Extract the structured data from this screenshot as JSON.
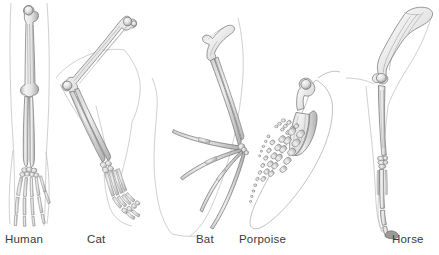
{
  "figure": {
    "style": "grayscale pencil / airbrush scientific illustration",
    "background_color": "#ffffff",
    "bone_fill_light": "#f2f2f2",
    "bone_fill_mid": "#d9d9d9",
    "bone_fill_dark": "#b4b4b4",
    "bone_outline_color": "#6e6e6e",
    "body_outline_color": "#a8a8a8",
    "label_color": "#3a3a3a"
  },
  "specimens": [
    {
      "id": "human",
      "label": "Human",
      "label_x": 5,
      "orientation": "vertical, hand down",
      "bones": [
        "humerus",
        "radius",
        "ulna",
        "carpals",
        "metacarpals",
        "phalanges"
      ],
      "digit_count": 5
    },
    {
      "id": "cat",
      "label": "Cat",
      "label_x": 87,
      "orientation": "flexed diagonal, paw down",
      "bones": [
        "humerus",
        "radius",
        "ulna",
        "carpals",
        "metacarpals",
        "phalanges"
      ],
      "digit_count": 5
    },
    {
      "id": "bat",
      "label": "Bat",
      "label_x": 196,
      "orientation": "wing spread, digits elongated",
      "bones": [
        "humerus",
        "radius",
        "ulna",
        "carpals",
        "metacarpals",
        "phalanges"
      ],
      "digit_count": 5
    },
    {
      "id": "porpoise",
      "label": "Porpoise",
      "label_x": 239,
      "orientation": "flipper, bones shortened and packed",
      "bones": [
        "humerus",
        "radius",
        "ulna",
        "carpals",
        "metacarpals",
        "phalanges"
      ],
      "digit_count": 5
    },
    {
      "id": "horse",
      "label": "Horse",
      "label_x": 392,
      "orientation": "vertical leg, hoof down",
      "bones": [
        "humerus",
        "radius",
        "ulna",
        "carpals",
        "cannon bone",
        "phalanges",
        "hoof"
      ],
      "digit_count": 1
    }
  ]
}
